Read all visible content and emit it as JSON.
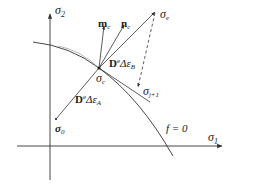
{
  "diagram": {
    "axes": {
      "x_label": "σ",
      "x_sub": "1",
      "y_label": "σ",
      "y_sub": "2"
    },
    "points": {
      "sigma_c": {
        "sym": "σ",
        "sub": "c"
      },
      "sigma_e": {
        "sym": "σ",
        "sub": "e"
      },
      "sigma_0": {
        "sym": "σ",
        "sub": "0"
      },
      "sigma_j1": {
        "sym": "σ",
        "sub": "j+1"
      }
    },
    "vectors": {
      "m_c": {
        "sym": "m",
        "sub": "c"
      },
      "n_c": {
        "sym": "n",
        "sub": "c"
      }
    },
    "increments": {
      "A": {
        "D": "D",
        "sup": "e",
        "delta": "Δε",
        "sub": "A"
      },
      "B": {
        "D": "D",
        "sup": "e",
        "delta": "Δε",
        "sub": "B"
      }
    },
    "yield_surface_label": "f = 0",
    "colors": {
      "line": "#333333",
      "text": "#222222"
    }
  }
}
